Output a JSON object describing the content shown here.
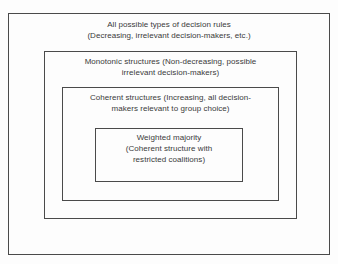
{
  "diagram": {
    "type": "nested-set-diagram",
    "background_color": "#fdfdfd",
    "border_color": "#4a4a4a",
    "text_color": "#3a3a3a",
    "levels": [
      {
        "id": "all-decision-rules",
        "level": 1,
        "label": "All possible types of decision rules\n(Decreasing, irrelevant decision-makers, etc.)",
        "line1": "All possible types of decision rules",
        "line2": "(Decreasing, irrelevant decision-makers, etc.)"
      },
      {
        "id": "monotonic-structures",
        "level": 2,
        "label": "Monotonic structures (Non-decreasing, possible\nirrelevant decision-makers)",
        "line1": "Monotonic structures (Non-decreasing, possible",
        "line2": "irrelevant decision-makers)"
      },
      {
        "id": "coherent-structures",
        "level": 3,
        "label": "Coherent structures (Increasing, all decision-\nmakers relevant to group choice)",
        "line1": "Coherent structures (Increasing, all decision-",
        "line2": "makers relevant to group choice)"
      },
      {
        "id": "weighted-majority",
        "level": 4,
        "label": "Weighted majority\n(Coherent structure with\nrestricted coalitions)",
        "line1": "Weighted majority",
        "line2": "(Coherent structure with",
        "line3": "restricted coalitions)"
      }
    ]
  }
}
